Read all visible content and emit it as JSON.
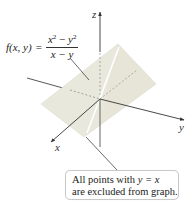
{
  "figure": {
    "type": "3d-surface-diagram",
    "axes": {
      "x_label": "x",
      "y_label": "y",
      "z_label": "z"
    },
    "function": {
      "lhs": "f(x, y)",
      "equals": "=",
      "numerator_a": "x",
      "numerator_a_exp": "2",
      "numerator_op": " − ",
      "numerator_b": "y",
      "numerator_b_exp": "2",
      "denominator": "x − y"
    },
    "callout": {
      "line1_prefix": "All points with ",
      "line1_math": "y = x",
      "line2": "are excluded from graph."
    },
    "colors": {
      "surface_fill": "#e9e8dc",
      "surface_edge": "#dcdbcf",
      "excluded_line": "#ffffff",
      "axis": "#333333",
      "callout_border": "#c9c9c9"
    }
  }
}
